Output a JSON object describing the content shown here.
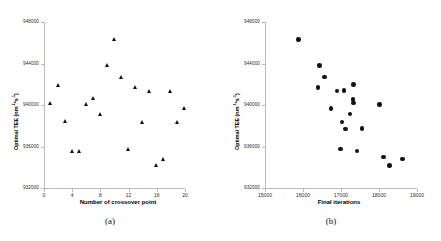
{
  "figure": {
    "panels": [
      {
        "key": "a",
        "caption": "(a)"
      },
      {
        "key": "b",
        "caption": "(b)"
      }
    ]
  },
  "chart_data": [
    {
      "type": "scatter",
      "panel": "(a)",
      "title": "",
      "xlabel": "Number of crossover point",
      "ylabel": "Optimal TEE (nm-1*s-1)",
      "ylabel_html": "Optimal TEE (nm<sup>-1</sup>*s<sup>-1</sup>)",
      "xlim": [
        0,
        20
      ],
      "ylim": [
        932000,
        948000
      ],
      "xticks": [
        0,
        4,
        8,
        12,
        16,
        20
      ],
      "xticklabels": [
        "0",
        "4",
        "8",
        "12",
        "16",
        "20"
      ],
      "yticks": [
        932000,
        936000,
        940000,
        944000,
        948000
      ],
      "yticklabels": [
        "932000",
        "936000",
        "940000",
        "944000",
        "948000"
      ],
      "grid": false,
      "legend": false,
      "marker": "triangle",
      "marker_color": "#111111",
      "x": [
        1,
        2,
        3,
        4,
        5,
        6,
        7,
        8,
        9,
        10,
        11,
        12,
        13,
        14,
        15,
        16,
        17,
        18,
        19,
        20
      ],
      "y": [
        940200,
        941950,
        938450,
        935550,
        935500,
        940050,
        940650,
        939150,
        943800,
        946300,
        942700,
        935750,
        941700,
        938350,
        941350,
        934150,
        934800,
        941300,
        938350,
        939650
      ]
    },
    {
      "type": "scatter",
      "panel": "(b)",
      "title": "",
      "xlabel": "Final iterations",
      "ylabel": "Optimal TEE (nm-1*s-1)",
      "ylabel_html": "Optimal TEE (nm<sup>-1</sup>*s<sup>-1</sup>)",
      "xlim": [
        15000,
        19000
      ],
      "ylim": [
        932000,
        948000
      ],
      "xticks": [
        15000,
        16000,
        17000,
        18000,
        19000
      ],
      "xticklabels": [
        "15000",
        "16000",
        "17000",
        "18000",
        "19000"
      ],
      "yticks": [
        932000,
        936000,
        940000,
        944000,
        948000
      ],
      "yticklabels": [
        "932000",
        "936000",
        "940000",
        "944000",
        "948000"
      ],
      "grid": false,
      "legend": false,
      "marker": "circle",
      "marker_color": "#111111",
      "x": [
        15880,
        16430,
        16560,
        16400,
        16890,
        17080,
        17330,
        17320,
        17330,
        16740,
        17240,
        17030,
        17120,
        17550,
        16990,
        17420,
        18010,
        18120,
        18280,
        18620
      ],
      "y": [
        946300,
        943800,
        942700,
        941700,
        941350,
        941400,
        942000,
        940550,
        940200,
        939650,
        939150,
        938350,
        937700,
        937750,
        935750,
        935550,
        940050,
        935000,
        934150,
        934800
      ]
    }
  ]
}
